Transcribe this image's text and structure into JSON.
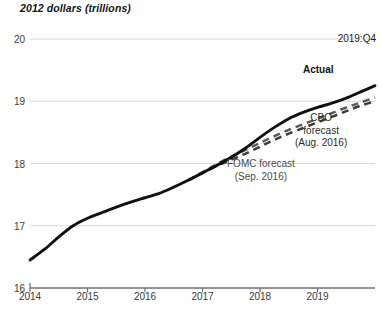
{
  "chart_data": {
    "type": "line",
    "title": "2012 dollars (trillions)",
    "xlabel": "",
    "ylabel": "2012 dollars (trillions)",
    "ylim": [
      16,
      20
    ],
    "xlim": [
      2014.0,
      2020.0
    ],
    "yticks": [
      16,
      17,
      18,
      19,
      20
    ],
    "xticks": [
      2014,
      2015,
      2016,
      2017,
      2018,
      2019
    ],
    "grid": true,
    "legend": "annotations-inline",
    "annotations": [
      {
        "name": "period-end",
        "text": "2019:Q4"
      },
      {
        "name": "actual-label",
        "text": "Actual"
      },
      {
        "name": "cbo-label",
        "text": "CBO\nforecast\n(Aug. 2016)"
      },
      {
        "name": "fomc-label",
        "text": "FOMC forecast\n(Sep. 2016)"
      }
    ],
    "series": [
      {
        "name": "Actual",
        "style": "solid",
        "color": "#111111",
        "x": [
          2014.0,
          2014.25,
          2014.5,
          2014.75,
          2015.0,
          2015.25,
          2015.5,
          2015.75,
          2016.0,
          2016.25,
          2016.5,
          2016.75,
          2017.0,
          2017.25,
          2017.5,
          2017.75,
          2018.0,
          2018.25,
          2018.5,
          2018.75,
          2019.0,
          2019.25,
          2019.5,
          2019.75,
          2020.0
        ],
        "values": [
          16.45,
          16.62,
          16.82,
          17.0,
          17.12,
          17.21,
          17.3,
          17.38,
          17.45,
          17.52,
          17.62,
          17.73,
          17.85,
          17.97,
          18.1,
          18.25,
          18.42,
          18.58,
          18.72,
          18.82,
          18.9,
          18.97,
          19.05,
          19.15,
          19.25
        ]
      },
      {
        "name": "CBO forecast (Aug. 2016)",
        "style": "dashed",
        "color": "#3b3b3b",
        "x": [
          2016.75,
          2017.0,
          2017.25,
          2017.5,
          2017.75,
          2018.0,
          2018.25,
          2018.5,
          2018.75,
          2019.0,
          2019.25,
          2019.5,
          2019.75,
          2020.0
        ],
        "values": [
          17.73,
          17.85,
          17.96,
          18.06,
          18.16,
          18.27,
          18.38,
          18.48,
          18.57,
          18.66,
          18.75,
          18.84,
          18.93,
          19.0
        ]
      },
      {
        "name": "FOMC forecast (Sep. 2016)",
        "style": "dashed",
        "color": "#5a5a5a",
        "x": [
          2016.75,
          2017.0,
          2017.25,
          2017.5,
          2017.75,
          2018.0,
          2018.25,
          2018.5,
          2018.75,
          2019.0,
          2019.25,
          2019.5,
          2019.75,
          2020.0
        ],
        "values": [
          17.73,
          17.86,
          17.99,
          18.11,
          18.22,
          18.33,
          18.44,
          18.54,
          18.63,
          18.72,
          18.81,
          18.9,
          18.98,
          19.06
        ]
      }
    ]
  },
  "ticks": {
    "y0": "16",
    "y1": "17",
    "y2": "18",
    "y3": "19",
    "y4": "20",
    "x0": "2014",
    "x1": "2015",
    "x2": "2016",
    "x3": "2017",
    "x4": "2018",
    "x5": "2019"
  },
  "labels": {
    "axis_title": "2012 dollars (trillions)",
    "period": "2019:Q4",
    "actual": "Actual",
    "cbo": "CBO\nforecast\n(Aug. 2016)",
    "fomc": "FOMC forecast\n(Sep. 2016)"
  },
  "colors": {
    "actual": "#111111",
    "cbo": "#3b3b3b",
    "fomc": "#5a5a5a",
    "grid": "#d8d8d8",
    "axis": "#6f6f6f"
  }
}
